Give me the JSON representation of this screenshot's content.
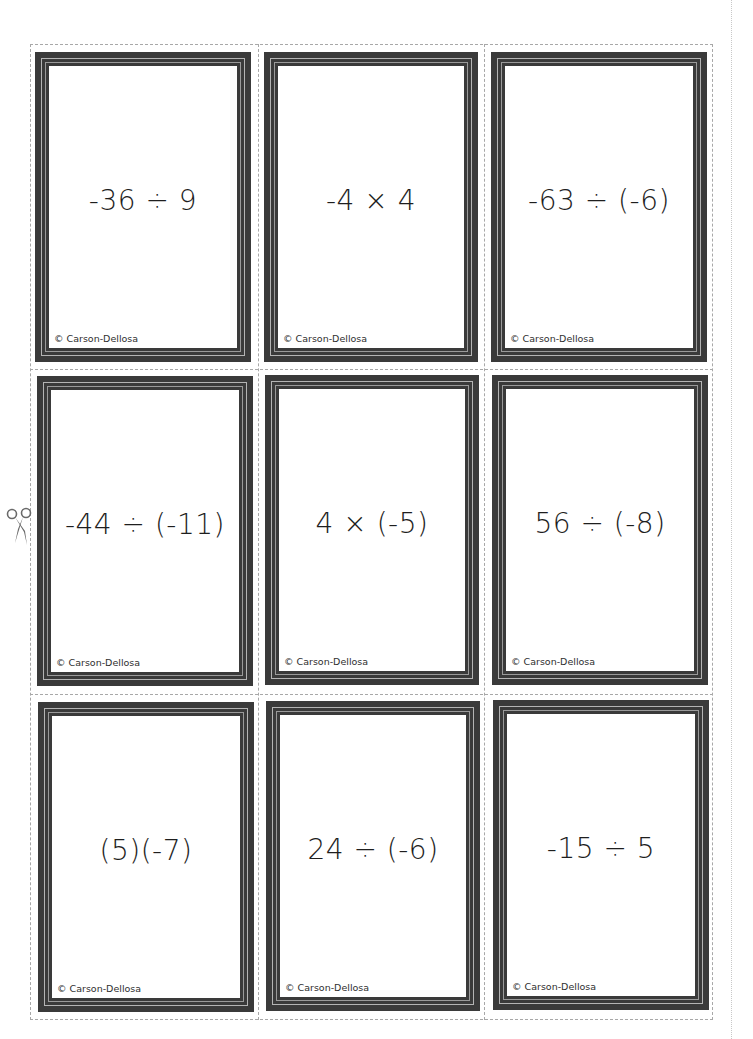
{
  "page": {
    "type": "printable flash card sheet",
    "background_color": "#ffffff",
    "frame_color": "#3a3a3a",
    "frame_highlight_color": "#b4b4b4",
    "cut_line_color": "#a8a8a8"
  },
  "icons": {
    "scissors": "scissors-icon"
  },
  "cards": [
    {
      "expression": "-36 ÷ 9",
      "copyright": "© Carson-Dellosa"
    },
    {
      "expression": "-4 × 4",
      "copyright": "© Carson-Dellosa"
    },
    {
      "expression": "-63 ÷ (-6)",
      "copyright": "© Carson-Dellosa"
    },
    {
      "expression": "-44 ÷ (-11)",
      "copyright": "© Carson-Dellosa"
    },
    {
      "expression": "4 × (-5)",
      "copyright": "© Carson-Dellosa"
    },
    {
      "expression": "56 ÷ (-8)",
      "copyright": "© Carson-Dellosa"
    },
    {
      "expression": "(5)(-7)",
      "copyright": "© Carson-Dellosa"
    },
    {
      "expression": "24 ÷ (-6)",
      "copyright": "© Carson-Dellosa"
    },
    {
      "expression": "-15 ÷ 5",
      "copyright": "© Carson-Dellosa"
    }
  ]
}
